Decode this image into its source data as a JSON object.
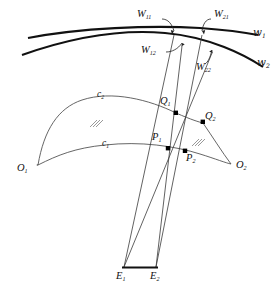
{
  "figure": {
    "type": "geometry-diagram",
    "title": ""
  },
  "labels": {
    "w11": "W",
    "w11_sub": "11",
    "w21": "W",
    "w21_sub": "21",
    "w12": "W",
    "w12_sub": "12",
    "w22": "W",
    "w22_sub": "22",
    "wave1": "w",
    "wave1_sub": "1",
    "wave2": "w",
    "wave2_sub": "2",
    "c1": "c",
    "c1_sub": "1",
    "c2": "c",
    "c2_sub": "2",
    "q1": "Q",
    "q1_sub": "1",
    "q2": "Q",
    "q2_sub": "2",
    "p1": "P",
    "p1_sub": "1",
    "p2": "P",
    "p2_sub": "2",
    "o1": "O",
    "o1_sub": "1",
    "o2": "O",
    "o2_sub": "2",
    "e1": "E",
    "e1_sub": "1",
    "e2": "E",
    "e2_sub": "2"
  },
  "colors": {
    "stroke_thick": "#111111",
    "stroke_thin": "#555555",
    "stroke_ray": "#333333",
    "point_fill": "#000000",
    "background": "#ffffff"
  },
  "geometry": {
    "points": {
      "E1": [
        124,
        267
      ],
      "E2": [
        156,
        267
      ],
      "P1": [
        168,
        148
      ],
      "P2": [
        185,
        151
      ],
      "Q1": [
        176,
        113
      ],
      "Q2": [
        203,
        122
      ],
      "W11": [
        174,
        35
      ],
      "W12": [
        182,
        46
      ],
      "W21": [
        202,
        35
      ],
      "W22": [
        212,
        53
      ],
      "O1": [
        38,
        166
      ],
      "O2": [
        231,
        163
      ]
    },
    "wave1_path": "M 28,38 Q 120,24 258,34",
    "wave2_path": "M 22,54 Q 120,28 262,64",
    "c1_path": "M 38,164 Q 90,148 140,144 Q 185,140 231,161",
    "c2_path": "M 38,164 Q 60,108 110,100 Q 160,94 203,122",
    "rays": [
      [
        "E1",
        "W11"
      ],
      [
        "E1",
        "W22"
      ],
      [
        "E2",
        "W12"
      ],
      [
        "E2",
        "W21"
      ]
    ]
  },
  "annotations": {
    "hatch_symbol": "hatch-mark",
    "hatch_left": [
      94,
      123
    ],
    "hatch_right": [
      196,
      142
    ]
  }
}
